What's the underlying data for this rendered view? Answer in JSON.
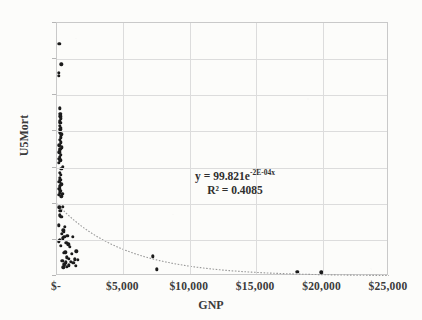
{
  "chart_data": {
    "type": "scatter",
    "title": "",
    "xlabel": "GNP",
    "ylabel": "U5Mort",
    "xlim": [
      0,
      25000
    ],
    "ylim": [
      0,
      350
    ],
    "grid": true,
    "legend": false,
    "xticks": [
      0,
      5000,
      10000,
      15000,
      20000,
      25000
    ],
    "xtick_labels": [
      "$-",
      "$5,000",
      "$10,000",
      "$15,000",
      "$20,000",
      "$25,000"
    ],
    "yticks": [
      0,
      50,
      100,
      150,
      200,
      250,
      300,
      350
    ],
    "ytick_labels": [
      "0",
      "50",
      "100",
      "150",
      "200",
      "250",
      "300",
      "350"
    ],
    "annotations": [
      {
        "name": "trendline-equation",
        "line1_prefix": "y = 99.821e",
        "line1_exponent": "-2E-04x",
        "line2": "R² = 0.4085"
      }
    ],
    "trendline": {
      "type": "exponential",
      "equation": "y = 99.821e^(-2E-04x)",
      "coefficient": 99.821,
      "exponent_rate": -0.0002,
      "r_squared": 0.4085,
      "style": "dotted",
      "color": "#9a9a9a"
    },
    "series": [
      {
        "name": "Countries",
        "marker": "circle",
        "color": "#1b1b1b",
        "points": [
          [
            180,
            321
          ],
          [
            330,
            293
          ],
          [
            150,
            281
          ],
          [
            155,
            277
          ],
          [
            210,
            232
          ],
          [
            240,
            224
          ],
          [
            260,
            221
          ],
          [
            280,
            218
          ],
          [
            225,
            214
          ],
          [
            255,
            212
          ],
          [
            215,
            208
          ],
          [
            300,
            205
          ],
          [
            235,
            203
          ],
          [
            195,
            199
          ],
          [
            330,
            196
          ],
          [
            265,
            192
          ],
          [
            205,
            188
          ],
          [
            290,
            185
          ],
          [
            175,
            181
          ],
          [
            340,
            178
          ],
          [
            240,
            176
          ],
          [
            195,
            174
          ],
          [
            160,
            171
          ],
          [
            300,
            168
          ],
          [
            225,
            165
          ],
          [
            185,
            162
          ],
          [
            260,
            160
          ],
          [
            150,
            157
          ],
          [
            420,
            151
          ],
          [
            330,
            148
          ],
          [
            210,
            143
          ],
          [
            280,
            140
          ],
          [
            195,
            136
          ],
          [
            240,
            133
          ],
          [
            170,
            130
          ],
          [
            310,
            127
          ],
          [
            225,
            124
          ],
          [
            180,
            121
          ],
          [
            260,
            118
          ],
          [
            200,
            115
          ],
          [
            390,
            114
          ],
          [
            150,
            112
          ],
          [
            330,
            110
          ],
          [
            175,
            95
          ],
          [
            420,
            96
          ],
          [
            250,
            90
          ],
          [
            200,
            84
          ],
          [
            310,
            82
          ],
          [
            140,
            70
          ],
          [
            600,
            68
          ],
          [
            470,
            63
          ],
          [
            520,
            61
          ],
          [
            350,
            58
          ],
          [
            780,
            56
          ],
          [
            560,
            54
          ],
          [
            1180,
            54
          ],
          [
            420,
            52
          ],
          [
            230,
            50
          ],
          [
            120,
            48
          ],
          [
            690,
            46
          ],
          [
            840,
            44
          ],
          [
            300,
            42
          ],
          [
            950,
            40
          ],
          [
            1460,
            34
          ],
          [
            640,
            33
          ],
          [
            520,
            32
          ],
          [
            1120,
            31
          ],
          [
            7200,
            27
          ],
          [
            760,
            26
          ],
          [
            880,
            24
          ],
          [
            1320,
            23
          ],
          [
            1560,
            22
          ],
          [
            400,
            21
          ],
          [
            1020,
            20
          ],
          [
            680,
            19
          ],
          [
            1240,
            18
          ],
          [
            560,
            16
          ],
          [
            900,
            15
          ],
          [
            1400,
            14
          ],
          [
            720,
            13
          ],
          [
            480,
            12
          ],
          [
            7500,
            9
          ],
          [
            18100,
            6
          ],
          [
            19900,
            5
          ]
        ]
      }
    ]
  }
}
